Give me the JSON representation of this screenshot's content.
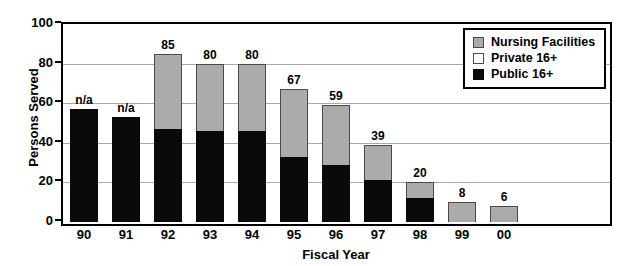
{
  "chart_data": {
    "type": "bar",
    "stacked": true,
    "title": "",
    "subtitle": "",
    "xlabel": "Fiscal Year",
    "ylabel": "Persons Served",
    "categories": [
      "90",
      "91",
      "92",
      "93",
      "94",
      "95",
      "96",
      "97",
      "98",
      "99",
      "00"
    ],
    "ylim": [
      0,
      100
    ],
    "yticks": [
      0,
      20,
      40,
      60,
      80,
      100
    ],
    "grid": true,
    "legend_position": "top-right",
    "series": [
      {
        "name": "Public 16+",
        "color": "#0a0a0a",
        "values": [
          57,
          53,
          47,
          46,
          46,
          33,
          29,
          21,
          12,
          0,
          0
        ]
      },
      {
        "name": "Private 16+",
        "color": "#ffffff",
        "values": [
          0,
          0,
          0,
          0,
          0,
          0,
          0,
          0,
          0,
          0,
          0
        ]
      },
      {
        "name": "Nursing Facilities",
        "color": "#ababab",
        "values": [
          0,
          0,
          38,
          34,
          34,
          34,
          30,
          18,
          8,
          10,
          8
        ]
      }
    ],
    "totals": [
      57,
      53,
      85,
      80,
      80,
      67,
      59,
      39,
      20,
      10,
      8
    ],
    "bar_labels": [
      "n/a",
      "n/a",
      "85",
      "80",
      "80",
      "67",
      "59",
      "39",
      "20",
      "8",
      "6"
    ],
    "annotations": [
      {
        "category": "90",
        "text": "n/a"
      },
      {
        "category": "91",
        "text": "n/a"
      }
    ]
  },
  "legend": {
    "items": [
      {
        "label": "Nursing Facilities",
        "swatch": "nursing"
      },
      {
        "label": "Private 16+",
        "swatch": "private"
      },
      {
        "label": "Public 16+",
        "swatch": "public"
      }
    ]
  },
  "axes": {
    "y_title": "Persons Served",
    "x_title": "Fiscal Year",
    "y_tick_labels": [
      "100",
      "80",
      "60",
      "40",
      "20",
      "0"
    ]
  },
  "colors": {
    "nursing": "#ababab",
    "private": "#ffffff",
    "public": "#0a0a0a",
    "grid": "#a9a9a9",
    "axis": "#000000"
  }
}
